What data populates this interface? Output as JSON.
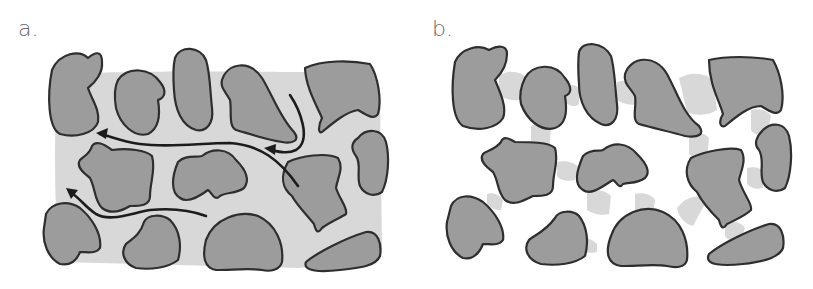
{
  "figure": {
    "panels": [
      {
        "id": "a",
        "label": "a.",
        "description": "Grains with connected pore space; arrows show fluid flow paths through pores",
        "flow_arrows": 3
      },
      {
        "id": "b",
        "label": "b.",
        "description": "Grains with pore fluid only at grain contacts (pendular rings); no continuous flow path",
        "flow_arrows": 0
      }
    ],
    "colors": {
      "grain_fill": "#9c9c9c",
      "grain_outline": "#2e2e2e",
      "pore_fluid": "#d8d8d8",
      "flow_arrow": "#1c1c1c",
      "background": "#ffffff",
      "label": "#6a6a6a"
    }
  }
}
